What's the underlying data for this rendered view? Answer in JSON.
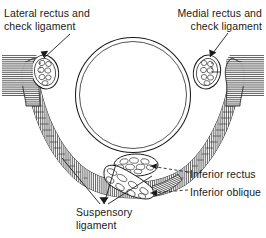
{
  "figure": {
    "background_color": "#ffffff",
    "ink_color": "#1a1a1a"
  },
  "labels": {
    "lateral_rectus": "Lateral rectus and\ncheck ligament",
    "medial_rectus": "Medial rectus and\ncheck ligament",
    "inferior_rectus": "Inferior rectus",
    "inferior_oblique": "Inferior oblique",
    "suspensory_ligament": "Suspensory\nligament"
  },
  "structures": {
    "eyeball": {
      "name": "eyeball",
      "cx": 133,
      "cy": 95,
      "r": 57
    },
    "lateral_rectus_muscle": {
      "name": "lateral-rectus-muscle",
      "cx": 45,
      "cy": 72
    },
    "medial_rectus_muscle": {
      "name": "medial-rectus-muscle",
      "cx": 207,
      "cy": 72
    },
    "inferior_rectus_muscle": {
      "name": "inferior-rectus-muscle",
      "cx": 136,
      "cy": 166
    },
    "inferior_oblique_muscle": {
      "name": "inferior-oblique-muscle",
      "cx": 128,
      "cy": 186
    }
  }
}
